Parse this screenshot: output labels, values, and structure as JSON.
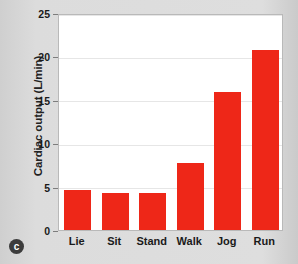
{
  "panel": {
    "letter": "c"
  },
  "chart_data": {
    "type": "bar",
    "title": "",
    "xlabel": "",
    "ylabel": "Cardiac output (L/min)",
    "categories": [
      "Lie",
      "Sit",
      "Stand",
      "Walk",
      "Jog",
      "Run"
    ],
    "values": [
      4.6,
      4.3,
      4.3,
      7.7,
      15.9,
      20.7
    ],
    "series": [
      {
        "name": "Cardiac output",
        "values": [
          4.6,
          4.3,
          4.3,
          7.7,
          15.9,
          20.7
        ]
      }
    ],
    "ylim": [
      0,
      25
    ],
    "yticks": [
      0,
      5,
      10,
      15,
      20,
      25
    ],
    "ytick_labels": [
      "0",
      "5",
      "10",
      "15",
      "20",
      "25"
    ],
    "grid": true,
    "legend": "none",
    "bar_color": "#ee2718",
    "plot_background": "#ffffff",
    "figure_background": "#d7d7d7",
    "gridline_color": "#e6e6e6"
  }
}
